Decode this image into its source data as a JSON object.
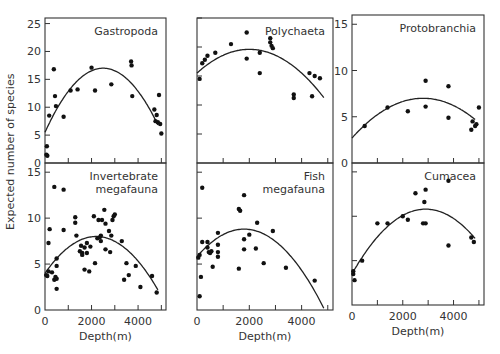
{
  "figure": {
    "ylabel": "Expected number of species",
    "xlabel": "Depth(m)"
  },
  "chart_data": [
    {
      "type": "scatter",
      "title": "Gastropoda",
      "xlabel": "Depth(m)",
      "ylabel": "Expected number of species",
      "xlim": [
        0,
        5200
      ],
      "ylim": [
        0,
        26
      ],
      "yticks": [
        0,
        5,
        10,
        15,
        20,
        25
      ],
      "xticks": [
        0,
        1000,
        2000,
        3000,
        4000,
        5000
      ],
      "points": [
        [
          60,
          1.5
        ],
        [
          80,
          3
        ],
        [
          100,
          1.3
        ],
        [
          180,
          8.5
        ],
        [
          380,
          16.8
        ],
        [
          430,
          12
        ],
        [
          470,
          10.2
        ],
        [
          800,
          8.3
        ],
        [
          1100,
          13
        ],
        [
          1400,
          13.2
        ],
        [
          2000,
          17.1
        ],
        [
          2150,
          13
        ],
        [
          2850,
          14.1
        ],
        [
          3700,
          18.2
        ],
        [
          3720,
          17.5
        ],
        [
          3750,
          12
        ],
        [
          4700,
          9.6
        ],
        [
          4750,
          7.5
        ],
        [
          4800,
          8.6
        ],
        [
          4850,
          7.3
        ],
        [
          4900,
          12.2
        ],
        [
          4950,
          7
        ],
        [
          5000,
          5.3
        ]
      ],
      "fit": {
        "peak_x": 2500,
        "peak_y": 17,
        "y0": 5.5,
        "y_end": 7.5
      }
    },
    {
      "type": "scatter",
      "title": "Polychaeta",
      "xlabel": "Depth(m)",
      "xlim": [
        0,
        5200
      ],
      "ylim": [
        0,
        25
      ],
      "yticks": [
        0,
        5,
        10,
        15,
        20,
        25
      ],
      "xticks": [
        0,
        1000,
        2000,
        3000,
        4000,
        5000
      ],
      "points": [
        [
          100,
          14.5
        ],
        [
          200,
          17.2
        ],
        [
          300,
          17.8
        ],
        [
          400,
          18.5
        ],
        [
          700,
          19
        ],
        [
          1300,
          20.5
        ],
        [
          1900,
          22.5
        ],
        [
          1900,
          18
        ],
        [
          2400,
          19
        ],
        [
          2400,
          15.5
        ],
        [
          2800,
          21.5
        ],
        [
          2800,
          20.8
        ],
        [
          2850,
          20.2
        ],
        [
          2900,
          19.8
        ],
        [
          3700,
          11.8
        ],
        [
          3700,
          11.2
        ],
        [
          4300,
          15.5
        ],
        [
          4400,
          11.5
        ],
        [
          4500,
          15
        ],
        [
          4700,
          14.6
        ]
      ],
      "fit": {
        "peak_x": 2000,
        "peak_y": 19.6,
        "y0": 15.5,
        "y_end": 10.5
      }
    },
    {
      "type": "scatter",
      "title": "Protobranchia",
      "xlabel": "Depth(m)",
      "xlim": [
        0,
        5200
      ],
      "ylim": [
        0,
        16
      ],
      "yticks": [
        0,
        5,
        10,
        15
      ],
      "xticks": [
        0,
        1000,
        2000,
        3000,
        4000,
        5000
      ],
      "points": [
        [
          500,
          4
        ],
        [
          1400,
          6
        ],
        [
          2200,
          5.6
        ],
        [
          2900,
          6.1
        ],
        [
          2900,
          8.9
        ],
        [
          3800,
          8.3
        ],
        [
          3800,
          4.9
        ],
        [
          4700,
          3.6
        ],
        [
          4750,
          4.5
        ],
        [
          4850,
          4
        ],
        [
          4900,
          4.2
        ],
        [
          5000,
          6
        ]
      ],
      "fit": {
        "peak_x": 2800,
        "peak_y": 7,
        "y0": 2.7,
        "y_end": 3.9
      }
    },
    {
      "type": "scatter",
      "title": "Invertebrate megafauna",
      "xlabel": "Depth(m)",
      "xlim": [
        0,
        5200
      ],
      "ylim": [
        0,
        16
      ],
      "yticks": [
        0,
        5,
        10,
        15
      ],
      "xticks": [
        0,
        1000,
        2000,
        3000,
        4000,
        5000
      ],
      "points": [
        [
          50,
          3.8
        ],
        [
          100,
          3.7
        ],
        [
          150,
          4.2
        ],
        [
          150,
          7.3
        ],
        [
          200,
          8.8
        ],
        [
          300,
          4.1
        ],
        [
          400,
          13.4
        ],
        [
          400,
          3.3
        ],
        [
          450,
          3.6
        ],
        [
          500,
          5.6
        ],
        [
          500,
          3.4
        ],
        [
          500,
          4.8
        ],
        [
          500,
          2.3
        ],
        [
          800,
          13.1
        ],
        [
          800,
          8.7
        ],
        [
          1300,
          10.1
        ],
        [
          1300,
          9.5
        ],
        [
          1350,
          8.1
        ],
        [
          1500,
          6.4
        ],
        [
          1550,
          7
        ],
        [
          1600,
          6.2
        ],
        [
          1600,
          6
        ],
        [
          1700,
          6.8
        ],
        [
          1700,
          4.4
        ],
        [
          1800,
          6.2
        ],
        [
          1800,
          7.3
        ],
        [
          1900,
          4.2
        ],
        [
          1950,
          6.9
        ],
        [
          2100,
          10.2
        ],
        [
          2150,
          5.1
        ],
        [
          2250,
          7.8
        ],
        [
          2300,
          9.8
        ],
        [
          2350,
          7.9
        ],
        [
          2400,
          8.1
        ],
        [
          2400,
          7.5
        ],
        [
          2450,
          9.8
        ],
        [
          2550,
          10.9
        ],
        [
          2600,
          6.6
        ],
        [
          2600,
          9.4
        ],
        [
          2750,
          8.6
        ],
        [
          2800,
          6.3
        ],
        [
          2850,
          8.1
        ],
        [
          2900,
          9.8
        ],
        [
          2950,
          10.2
        ],
        [
          3000,
          10.4
        ],
        [
          3300,
          7.5
        ],
        [
          3400,
          3.3
        ],
        [
          3500,
          5.1
        ],
        [
          3600,
          3.8
        ],
        [
          3900,
          4.8
        ],
        [
          4100,
          2.5
        ],
        [
          4600,
          3.7
        ],
        [
          4800,
          1.9
        ]
      ],
      "fit": {
        "peak_x": 2200,
        "peak_y": 8,
        "y0": 4,
        "y_end": 1
      }
    },
    {
      "type": "scatter",
      "title": "Fish megafauna",
      "xlabel": "Depth(m)",
      "xlim": [
        0,
        5200
      ],
      "ylim": [
        0,
        16
      ],
      "yticks": [
        0,
        5,
        10,
        15
      ],
      "xticks": [
        0,
        1000,
        2000,
        3000,
        4000,
        5000
      ],
      "points": [
        [
          50,
          5.7
        ],
        [
          100,
          6
        ],
        [
          100,
          1.5
        ],
        [
          150,
          3.6
        ],
        [
          200,
          13.3
        ],
        [
          200,
          7.4
        ],
        [
          400,
          7.4
        ],
        [
          400,
          6.8
        ],
        [
          450,
          6.3
        ],
        [
          500,
          6.2
        ],
        [
          550,
          6.4
        ],
        [
          600,
          4.7
        ],
        [
          800,
          8.4
        ],
        [
          800,
          7.1
        ],
        [
          800,
          6.3
        ],
        [
          800,
          5.8
        ],
        [
          1600,
          4.5
        ],
        [
          1600,
          11
        ],
        [
          1650,
          10.8
        ],
        [
          1800,
          12.5
        ],
        [
          1800,
          7.7
        ],
        [
          1800,
          6.6
        ],
        [
          2000,
          8.2
        ],
        [
          2250,
          6.7
        ],
        [
          2300,
          9.5
        ],
        [
          2550,
          5.1
        ],
        [
          2900,
          8.6
        ],
        [
          3400,
          4.6
        ],
        [
          4500,
          3.2
        ]
      ],
      "fit": {
        "peak_x": 1800,
        "peak_y": 8.8,
        "y0": 5.8,
        "y_end": 2.6
      }
    },
    {
      "type": "scatter",
      "title": "Cumacea",
      "xlabel": "Depth(m)",
      "xlim": [
        0,
        5200
      ],
      "ylim": [
        0,
        16
      ],
      "yticks": [
        0,
        5,
        10,
        15
      ],
      "xticks": [
        0,
        1000,
        2000,
        3000,
        4000,
        5000
      ],
      "points": [
        [
          50,
          3.8
        ],
        [
          50,
          3.5
        ],
        [
          100,
          2.8
        ],
        [
          400,
          5
        ],
        [
          1000,
          9.2
        ],
        [
          1400,
          9.2
        ],
        [
          2000,
          10
        ],
        [
          2200,
          9.6
        ],
        [
          2500,
          12.6
        ],
        [
          2800,
          9.2
        ],
        [
          2900,
          9.2
        ],
        [
          2850,
          11.6
        ],
        [
          2900,
          13
        ],
        [
          3800,
          14
        ],
        [
          3800,
          6.7
        ],
        [
          4700,
          7.6
        ],
        [
          4800,
          7.1
        ]
      ],
      "fit": {
        "peak_x": 2900,
        "peak_y": 10.8,
        "y0": 3.5,
        "y_end": 6.5
      }
    }
  ]
}
